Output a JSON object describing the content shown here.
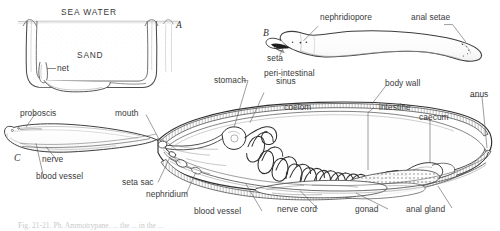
{
  "figure": {
    "caption_partial": "Fig.  21-21.  Ph. Ammotrypane.  ... the ... in the ...",
    "panels": [
      {
        "id": "A",
        "name": "burrow-in-sand"
      },
      {
        "id": "B",
        "name": "external-whole-animal"
      },
      {
        "id": "C",
        "name": "internal-anatomy-sagittal"
      }
    ]
  },
  "panel_a": {
    "id": "A",
    "labels": {
      "sea_water": "SEA WATER",
      "sand": "SAND",
      "net": "net"
    }
  },
  "panel_b": {
    "id": "B",
    "labels": {
      "nephridiopore": "nephridiopore",
      "anal_setae": "anal setae",
      "seta": "seta"
    }
  },
  "panel_c": {
    "id": "C",
    "labels": {
      "proboscis": "proboscis",
      "mouth": "mouth",
      "nerve": "nerve",
      "blood_vessel_anterior": "blood vessel",
      "stomach": "stomach",
      "peri_intestinal_sinus_line1": "peri-intestinal",
      "peri_intestinal_sinus_line2": "sinus",
      "body_wall": "body wall",
      "coelom": "coelom",
      "intestine": "intestine",
      "caecum": "caecum",
      "anus": "anus",
      "seta_sac": "seta sac",
      "nephridium": "nephridium",
      "blood_vessel_ventral": "blood vessel",
      "nerve_cord": "nerve cord",
      "gonad": "gonad",
      "anal_gland": "anal gland"
    }
  },
  "style": {
    "ink": "#262626",
    "ink_light": "#6f6f6f",
    "paper": "#ffffff",
    "stipple": "#d9d9d9",
    "text": "#3a3a3a"
  }
}
